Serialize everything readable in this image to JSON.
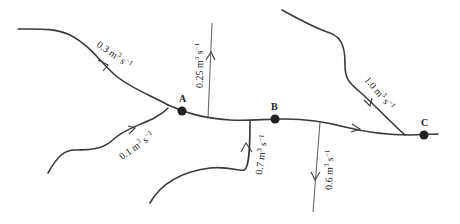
{
  "diagram": {
    "type": "river network flow diagram",
    "nodes": [
      {
        "id": "A",
        "label": "A"
      },
      {
        "id": "B",
        "label": "B"
      },
      {
        "id": "C",
        "label": "C"
      }
    ],
    "flows": [
      {
        "id": "trib_nw",
        "value": "0.3",
        "unit": "m",
        "unit_exp": "3",
        "unit2": "s",
        "unit2_exp": "−1",
        "direction": "inflow to A"
      },
      {
        "id": "trib_sw",
        "value": "0.1",
        "unit": "m",
        "unit_exp": "3",
        "unit2": "s",
        "unit2_exp": "−1",
        "direction": "inflow to A"
      },
      {
        "id": "abs_1",
        "value": "0.25",
        "unit": "m",
        "unit_exp": "3",
        "unit2": "s",
        "unit2_exp": "−1",
        "direction": "outflow between A and B"
      },
      {
        "id": "trib_s",
        "value": "0.7",
        "unit": "m",
        "unit_exp": "3",
        "unit2": "s",
        "unit2_exp": "−1",
        "direction": "inflow before B"
      },
      {
        "id": "abs_2",
        "value": "0.6",
        "unit": "m",
        "unit_exp": "3",
        "unit2": "s",
        "unit2_exp": "−1",
        "direction": "outflow between B and C"
      },
      {
        "id": "trib_ne",
        "value": "1.0",
        "unit": "m",
        "unit_exp": "3",
        "unit2": "s",
        "unit2_exp": "−1",
        "direction": "inflow before C"
      }
    ]
  }
}
